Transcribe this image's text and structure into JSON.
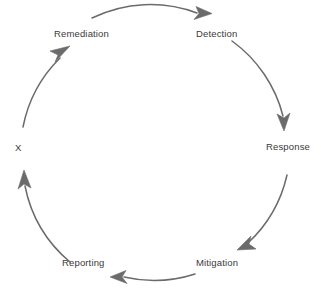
{
  "diagram": {
    "title": "",
    "type": "circular-cycle",
    "direction": "clockwise",
    "background_color": "#ffffff",
    "stroke_color": "#6b6b6b",
    "text_color": "#3a3a3a",
    "geometry": {
      "center_x": 155,
      "center_y": 145,
      "radius": 133
    },
    "nodes": [
      {
        "id": "remediation",
        "label": "Remediation",
        "angle_deg": 300
      },
      {
        "id": "detection",
        "label": "Detection",
        "angle_deg": 0
      },
      {
        "id": "response",
        "label": "Response",
        "angle_deg": 60
      },
      {
        "id": "mitigation",
        "label": "Mitigation",
        "angle_deg": 120
      },
      {
        "id": "reporting",
        "label": "Reporting",
        "angle_deg": 180
      },
      {
        "id": "x",
        "label": "X",
        "angle_deg": 240
      }
    ],
    "edges": [
      {
        "from": "remediation",
        "to": "detection",
        "arrowhead": "filled-triangle"
      },
      {
        "from": "detection",
        "to": "response",
        "arrowhead": "filled-triangle"
      },
      {
        "from": "response",
        "to": "mitigation",
        "arrowhead": "filled-triangle"
      },
      {
        "from": "mitigation",
        "to": "reporting",
        "arrowhead": "filled-triangle"
      },
      {
        "from": "reporting",
        "to": "x",
        "arrowhead": "filled-triangle"
      },
      {
        "from": "x",
        "to": "remediation",
        "arrowhead": "filled-triangle"
      }
    ]
  }
}
